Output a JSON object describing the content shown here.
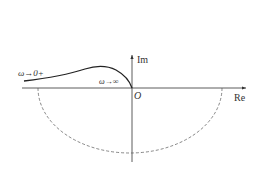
{
  "diagram": {
    "type": "nyquist-plot",
    "axes": {
      "real_label": "Re",
      "imag_label": "Im",
      "origin_label": "O"
    },
    "annotations": {
      "low_freq": "ω→0+",
      "high_freq": "ω→∞"
    },
    "colors": {
      "axis": "#333333",
      "curve": "#222222",
      "dashed_arc": "#555555",
      "background": "#ffffff"
    }
  }
}
